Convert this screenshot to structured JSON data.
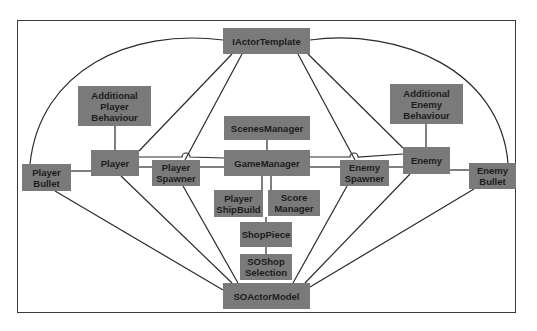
{
  "diagram": {
    "type": "class-relationship-diagram",
    "colors": {
      "node_fill": "#7a7a7a",
      "node_text": "#1c1c1c",
      "edge": "#2a2a2a",
      "frame": "#3a3a3a"
    },
    "nodes": {
      "iactor_template": "IActorTemplate",
      "additional_player_behaviour": "Additional\nPlayer\nBehaviour",
      "additional_enemy_behaviour": "Additional\nEnemy\nBehaviour",
      "scenes_manager": "ScenesManager",
      "player": "Player",
      "game_manager": "GameManager",
      "player_spawner": "Player\nSpawner",
      "enemy_spawner": "Enemy\nSpawner",
      "enemy": "Enemy",
      "player_bullet": "Player\nBullet",
      "enemy_bullet": "Enemy\nBullet",
      "player_shipbuild": "Player\nShipBuild",
      "score_manager": "Score\nManager",
      "shop_piece": "ShopPiece",
      "soshop_selection": "SOShop\nSelection",
      "soactor_model": "SOActorModel"
    },
    "edges": [
      [
        "IActorTemplate",
        "Player"
      ],
      [
        "IActorTemplate",
        "Player Spawner"
      ],
      [
        "IActorTemplate",
        "Enemy Spawner"
      ],
      [
        "IActorTemplate",
        "Enemy"
      ],
      [
        "IActorTemplate",
        "Player Bullet"
      ],
      [
        "IActorTemplate",
        "Enemy Bullet"
      ],
      [
        "Additional Player Behaviour",
        "Player"
      ],
      [
        "Additional Enemy Behaviour",
        "Enemy"
      ],
      [
        "ScenesManager",
        "GameManager"
      ],
      [
        "Player",
        "GameManager"
      ],
      [
        "Player",
        "Player Spawner"
      ],
      [
        "Player",
        "Player Bullet"
      ],
      [
        "Player Spawner",
        "GameManager"
      ],
      [
        "GameManager",
        "Enemy Spawner"
      ],
      [
        "GameManager",
        "Enemy"
      ],
      [
        "Enemy Spawner",
        "Enemy"
      ],
      [
        "Enemy",
        "Enemy Bullet"
      ],
      [
        "GameManager",
        "Player ShipBuild"
      ],
      [
        "GameManager",
        "Score Manager"
      ],
      [
        "Player ShipBuild",
        "ShopPiece"
      ],
      [
        "ShopPiece",
        "SOShop Selection"
      ],
      [
        "SOShop Selection",
        "SOActorModel"
      ],
      [
        "SOActorModel",
        "Player Bullet"
      ],
      [
        "SOActorModel",
        "Player"
      ],
      [
        "SOActorModel",
        "Player Spawner"
      ],
      [
        "SOActorModel",
        "Enemy Spawner"
      ],
      [
        "SOActorModel",
        "Enemy"
      ],
      [
        "SOActorModel",
        "Enemy Bullet"
      ]
    ]
  }
}
